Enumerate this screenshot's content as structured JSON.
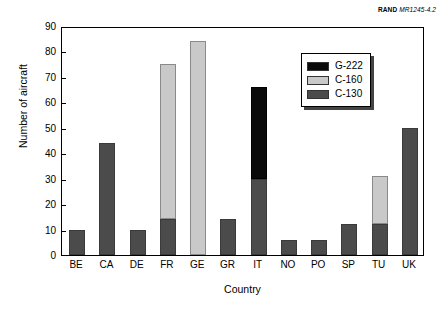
{
  "source_credit": {
    "mark": "RAND",
    "document": "MR1245-4.2"
  },
  "chart_data": {
    "type": "bar",
    "stacked": true,
    "title": "",
    "xlabel": "Country",
    "ylabel": "Number of aircraft",
    "ylim": [
      0,
      90
    ],
    "ytick_step": 10,
    "yticks": [
      "0",
      "10",
      "20",
      "30",
      "40",
      "50",
      "60",
      "70",
      "80",
      "90"
    ],
    "grid": false,
    "legend_position": "upper-right-inside",
    "categories": [
      "BE",
      "CA",
      "DE",
      "FR",
      "GE",
      "GR",
      "IT",
      "NO",
      "PO",
      "SP",
      "TU",
      "UK"
    ],
    "series": [
      {
        "name": "C-130",
        "color": "#4b4b4b",
        "values": [
          10,
          44,
          10,
          14,
          0,
          14,
          30,
          6,
          6,
          12,
          12,
          50
        ]
      },
      {
        "name": "C-160",
        "color": "#c9c9c9",
        "values": [
          0,
          0,
          0,
          61,
          84,
          0,
          0,
          0,
          0,
          0,
          19,
          0
        ]
      },
      {
        "name": "G-222",
        "color": "#0a0a0a",
        "values": [
          0,
          0,
          0,
          0,
          0,
          0,
          36,
          0,
          0,
          0,
          0,
          0
        ]
      }
    ],
    "totals": [
      10,
      44,
      10,
      75,
      84,
      14,
      66,
      6,
      6,
      12,
      31,
      50
    ],
    "legend_entries": [
      {
        "label": "G-222",
        "color": "#0a0a0a"
      },
      {
        "label": "C-160",
        "color": "#c9c9c9"
      },
      {
        "label": "C-130",
        "color": "#4b4b4b"
      }
    ]
  }
}
